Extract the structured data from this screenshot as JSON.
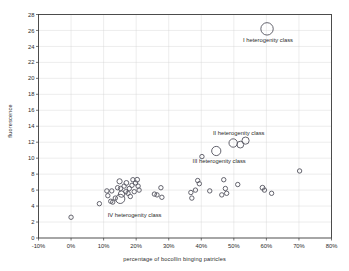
{
  "chart_data": {
    "type": "scatter",
    "title": "",
    "xlabel": "percentage of bocollin binging patricles",
    "ylabel": "fluorescence",
    "xlim": [
      -10,
      80
    ],
    "ylim": [
      0,
      28
    ],
    "xticks": [
      "-10%",
      "0%",
      "10%",
      "20%",
      "30%",
      "40%",
      "50%",
      "60%",
      "70%",
      "80%"
    ],
    "xtick_values": [
      -10,
      0,
      10,
      20,
      30,
      40,
      50,
      60,
      70,
      80
    ],
    "yticks": [
      "0",
      "2",
      "4",
      "6",
      "8",
      "10",
      "12",
      "14",
      "16",
      "18",
      "20",
      "22",
      "24",
      "26",
      "28"
    ],
    "ytick_values": [
      0,
      2,
      4,
      6,
      8,
      10,
      12,
      14,
      16,
      18,
      20,
      22,
      24,
      26,
      28
    ],
    "grid": true,
    "legend": "none",
    "marker_style": "open-circle",
    "marker_color": "#5c5c66",
    "x_unit": "percent",
    "annotations": [
      {
        "label": "I heterogenity class",
        "x": 60.5,
        "y": 24.6,
        "anchor": "middle"
      },
      {
        "label": "II heterogenity class",
        "x": 51.5,
        "y": 12.9,
        "anchor": "middle"
      },
      {
        "label": "III heterogenity class",
        "x": 45.5,
        "y": 9.4,
        "anchor": "middle"
      },
      {
        "label": "IV heterogenity class",
        "x": 19.5,
        "y": 2.6,
        "anchor": "middle"
      }
    ],
    "points": [
      {
        "x": 0.0,
        "y": 2.6,
        "r": 2.2
      },
      {
        "x": 8.7,
        "y": 4.3,
        "r": 2.2
      },
      {
        "x": 11.0,
        "y": 5.9,
        "r": 2.2
      },
      {
        "x": 11.3,
        "y": 5.3,
        "r": 2.2
      },
      {
        "x": 12.5,
        "y": 5.9,
        "r": 2.2
      },
      {
        "x": 12.2,
        "y": 4.6,
        "r": 2.2
      },
      {
        "x": 12.8,
        "y": 4.5,
        "r": 2.2
      },
      {
        "x": 13.6,
        "y": 5.0,
        "r": 2.2
      },
      {
        "x": 14.3,
        "y": 6.3,
        "r": 2.2
      },
      {
        "x": 14.9,
        "y": 7.1,
        "r": 2.6
      },
      {
        "x": 15.2,
        "y": 6.2,
        "r": 2.2
      },
      {
        "x": 15.5,
        "y": 5.5,
        "r": 3.2
      },
      {
        "x": 15.1,
        "y": 4.9,
        "r": 4.6
      },
      {
        "x": 16.3,
        "y": 6.5,
        "r": 2.2
      },
      {
        "x": 16.8,
        "y": 5.8,
        "r": 2.2
      },
      {
        "x": 17.0,
        "y": 6.9,
        "r": 2.4
      },
      {
        "x": 17.5,
        "y": 5.6,
        "r": 2.2
      },
      {
        "x": 17.9,
        "y": 6.2,
        "r": 2.2
      },
      {
        "x": 18.2,
        "y": 5.2,
        "r": 2.2
      },
      {
        "x": 18.7,
        "y": 6.6,
        "r": 2.2
      },
      {
        "x": 19.0,
        "y": 7.3,
        "r": 2.2
      },
      {
        "x": 19.4,
        "y": 5.8,
        "r": 2.2
      },
      {
        "x": 19.8,
        "y": 6.9,
        "r": 2.2
      },
      {
        "x": 20.3,
        "y": 7.3,
        "r": 2.4
      },
      {
        "x": 20.6,
        "y": 6.5,
        "r": 2.2
      },
      {
        "x": 20.9,
        "y": 6.0,
        "r": 2.2
      },
      {
        "x": 25.6,
        "y": 5.5,
        "r": 2.2
      },
      {
        "x": 26.4,
        "y": 5.4,
        "r": 2.2
      },
      {
        "x": 27.6,
        "y": 6.3,
        "r": 2.2
      },
      {
        "x": 27.9,
        "y": 5.1,
        "r": 2.2
      },
      {
        "x": 36.8,
        "y": 5.7,
        "r": 2.2
      },
      {
        "x": 37.1,
        "y": 5.0,
        "r": 2.2
      },
      {
        "x": 38.2,
        "y": 6.0,
        "r": 2.2
      },
      {
        "x": 38.9,
        "y": 7.2,
        "r": 2.2
      },
      {
        "x": 39.4,
        "y": 6.8,
        "r": 2.2
      },
      {
        "x": 40.2,
        "y": 10.2,
        "r": 2.2
      },
      {
        "x": 42.6,
        "y": 5.9,
        "r": 2.2
      },
      {
        "x": 44.6,
        "y": 10.9,
        "r": 4.6
      },
      {
        "x": 46.3,
        "y": 5.4,
        "r": 2.2
      },
      {
        "x": 46.9,
        "y": 7.3,
        "r": 2.2
      },
      {
        "x": 47.4,
        "y": 6.2,
        "r": 2.2
      },
      {
        "x": 47.8,
        "y": 5.6,
        "r": 2.2
      },
      {
        "x": 49.8,
        "y": 11.9,
        "r": 4.2
      },
      {
        "x": 51.2,
        "y": 6.7,
        "r": 2.2
      },
      {
        "x": 52.0,
        "y": 11.7,
        "r": 3.4
      },
      {
        "x": 53.6,
        "y": 12.2,
        "r": 3.6
      },
      {
        "x": 58.8,
        "y": 6.3,
        "r": 2.4
      },
      {
        "x": 59.4,
        "y": 6.0,
        "r": 2.2
      },
      {
        "x": 60.2,
        "y": 26.2,
        "r": 6.2
      },
      {
        "x": 61.6,
        "y": 5.6,
        "r": 2.2
      },
      {
        "x": 70.2,
        "y": 8.4,
        "r": 2.2
      }
    ]
  }
}
